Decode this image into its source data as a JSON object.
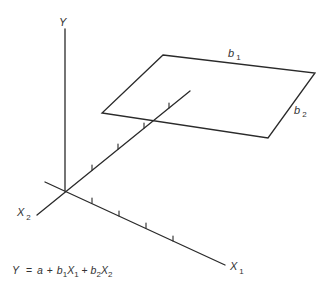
{
  "diagram": {
    "axes": {
      "y": {
        "label": "Y"
      },
      "x1": {
        "label": "X",
        "subscript": "1"
      },
      "x2": {
        "label": "X",
        "subscript": "2"
      }
    },
    "plane": {
      "edge_b1": {
        "label": "b",
        "subscript": "1"
      },
      "edge_b2": {
        "label": "b",
        "subscript": "2"
      }
    },
    "equation": {
      "lhs": "Y",
      "equals": "=",
      "a": "a",
      "plus1": "+",
      "b1": "b",
      "b1_sub": "1",
      "x1": "X",
      "x1_sub": "1",
      "plus2": "+",
      "b2": "b",
      "b2_sub": "2",
      "x2": "X",
      "x2_sub": "2"
    },
    "x1_tick_count": 4,
    "x2_tick_count": 4,
    "line_color": "#2a2a2a"
  }
}
